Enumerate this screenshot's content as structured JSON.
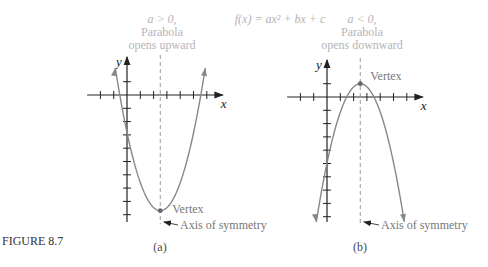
{
  "figure": {
    "caption": "FIGURE 8.7",
    "equation": "f(x) = ax² + bx + c",
    "panels": [
      {
        "id": "a",
        "label": "(a)",
        "condition": "a > 0,",
        "desc_line1": "Parabola",
        "desc_line2": "opens upward",
        "direction": "up",
        "vertex_label": "Vertex",
        "axis_label": "Axis of symmetry",
        "x_axis_label": "x",
        "y_axis_label": "y",
        "vertex": [
          2.5,
          -8.7
        ],
        "x_ticks": [
          -2,
          -1,
          1,
          2,
          3,
          4,
          5,
          6
        ],
        "y_ticks": [
          1,
          -1,
          -2,
          -3,
          -4,
          -5,
          -6,
          -7,
          -8,
          -9
        ]
      },
      {
        "id": "b",
        "label": "(b)",
        "condition": "a < 0,",
        "desc_line1": "Parabola",
        "desc_line2": "opens downward",
        "direction": "down",
        "vertex_label": "Vertex",
        "axis_label": "Axis of symmetry",
        "x_axis_label": "x",
        "y_axis_label": "y",
        "vertex": [
          2.5,
          1
        ],
        "x_ticks": [
          -2,
          -1,
          1,
          2,
          3,
          4,
          5,
          6
        ],
        "y_ticks": [
          1,
          -1,
          -2,
          -3,
          -4,
          -5,
          -6,
          -7,
          -8,
          -9
        ]
      }
    ]
  }
}
